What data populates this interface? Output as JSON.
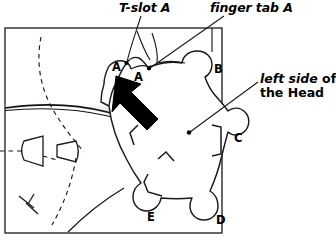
{
  "figure": {
    "title_labels": {
      "tslot": "T-slot A",
      "finger_tab": "finger tab A",
      "side_line1_italic": "left side",
      "side_line1_roman": " of",
      "side_line2_roman": "the ",
      "side_line2_bold": "Head"
    },
    "tab_letters": [
      {
        "name": "tab-a-outer",
        "label": "A",
        "x": 112,
        "y": 60
      },
      {
        "name": "tab-a-inner",
        "label": "A",
        "x": 134,
        "y": 70
      },
      {
        "name": "tab-b",
        "label": "B",
        "x": 214,
        "y": 62
      },
      {
        "name": "tab-c",
        "label": "C",
        "x": 234,
        "y": 131
      },
      {
        "name": "tab-d",
        "label": "D",
        "x": 216,
        "y": 213
      },
      {
        "name": "tab-e",
        "label": "E",
        "x": 147,
        "y": 210
      }
    ],
    "colors": {
      "ink": "#1a1a1a",
      "outline": "#000000",
      "arrow_fill": "#000000",
      "shadow_gray": "#c8c8c8",
      "background": "#ffffff"
    },
    "annotations": {
      "leader_dot_tslot": "dot at T-slot A notch",
      "leader_dot_finger": "dot at finger tab A",
      "leader_dot_head": "dot at left side of Head",
      "arrow_direction": "up-left"
    }
  }
}
